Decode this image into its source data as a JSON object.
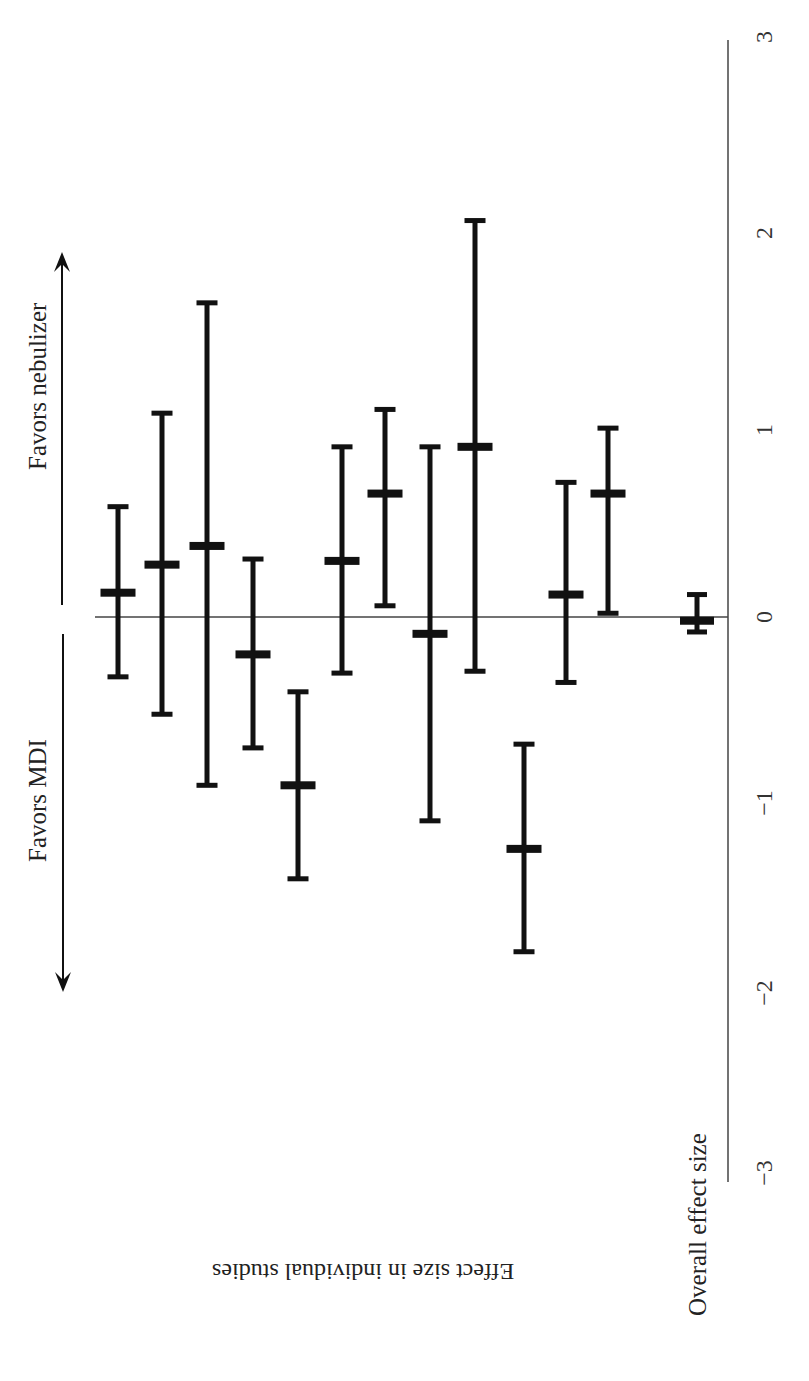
{
  "figure": {
    "orientation": "rotated 90 degrees (value axis vertical, increasing upward)",
    "favors_right_label": "Favors nebulizer",
    "favors_left_label": "Favors MDI",
    "individual_label": "Effect size in individual studies",
    "overall_label": "Overall effect size",
    "ticks": [
      "3",
      "2",
      "1",
      "0",
      "−1",
      "−2",
      "−3"
    ],
    "colors": {
      "bars": "#111111",
      "axis": "#444444",
      "text": "#222222",
      "background": "#ffffff"
    }
  },
  "chart_data": {
    "type": "forest",
    "title": "",
    "xlabel": "Effect size",
    "ylabel": "",
    "xlim": [
      -3,
      3
    ],
    "tick_values": [
      -3,
      -2,
      -1,
      0,
      1,
      2,
      3
    ],
    "tick_labels": [
      "−3",
      "−2",
      "−1",
      "0",
      "1",
      "2",
      "3"
    ],
    "reference_line": 0,
    "annotations": [
      "Favors MDI",
      "Favors nebulizer",
      "Effect size in individual studies",
      "Overall effect size"
    ],
    "studies": [
      {
        "index": 1,
        "estimate": 0.13,
        "ci_low": -0.32,
        "ci_high": 0.59
      },
      {
        "index": 2,
        "estimate": 0.28,
        "ci_low": -0.52,
        "ci_high": 1.09
      },
      {
        "index": 3,
        "estimate": 0.38,
        "ci_low": -0.9,
        "ci_high": 1.68
      },
      {
        "index": 4,
        "estimate": -0.2,
        "ci_low": -0.7,
        "ci_high": 0.31
      },
      {
        "index": 5,
        "estimate": -0.9,
        "ci_low": -1.4,
        "ci_high": -0.4
      },
      {
        "index": 6,
        "estimate": 0.3,
        "ci_low": -0.3,
        "ci_high": 0.91
      },
      {
        "index": 7,
        "estimate": 0.66,
        "ci_low": 0.06,
        "ci_high": 1.11
      },
      {
        "index": 8,
        "estimate": -0.09,
        "ci_low": -1.09,
        "ci_high": 0.91
      },
      {
        "index": 9,
        "estimate": 0.91,
        "ci_low": -0.29,
        "ci_high": 2.12
      },
      {
        "index": 10,
        "estimate": -1.24,
        "ci_low": -1.79,
        "ci_high": -0.68
      },
      {
        "index": 11,
        "estimate": 0.12,
        "ci_low": -0.35,
        "ci_high": 0.72
      },
      {
        "index": 12,
        "estimate": 0.66,
        "ci_low": 0.02,
        "ci_high": 1.01
      }
    ],
    "overall": {
      "estimate": -0.02,
      "ci_low": -0.08,
      "ci_high": 0.12
    },
    "grid": false,
    "legend": null
  }
}
